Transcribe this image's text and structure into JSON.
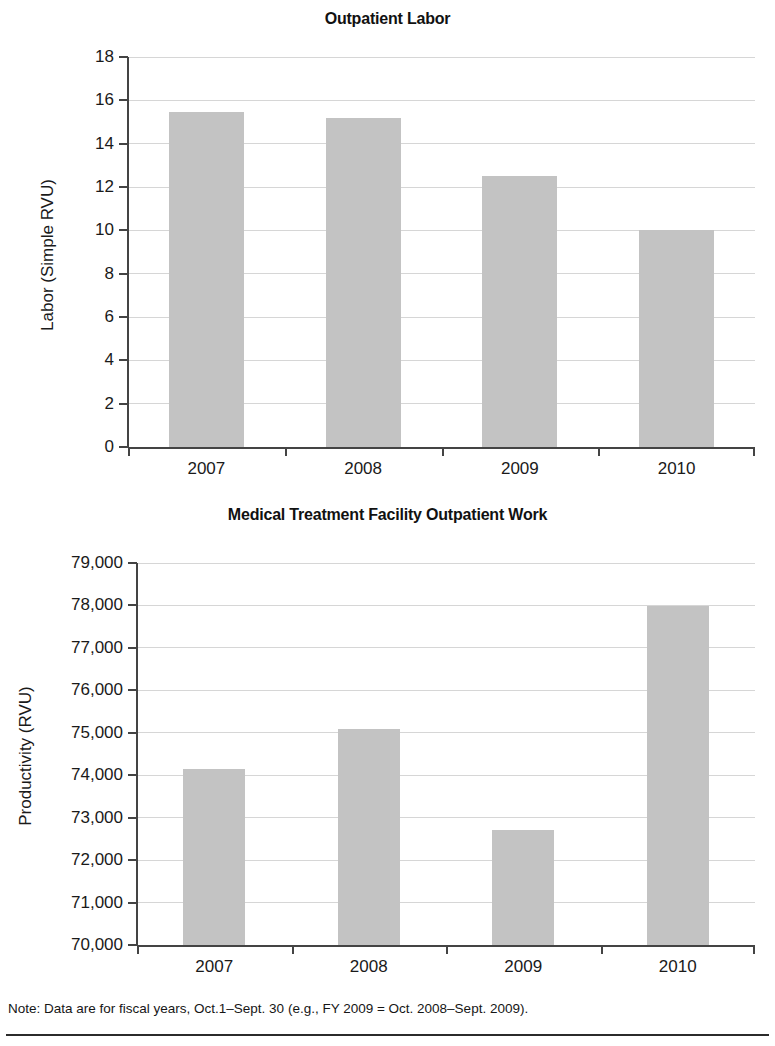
{
  "page": {
    "note": "Note: Data are for fiscal years, Oct.1–Sept. 30 (e.g., FY 2009 = Oct. 2008–Sept. 2009)."
  },
  "chart_data": [
    {
      "type": "bar",
      "title": "Outpatient Labor",
      "xlabel": "",
      "ylabel": "Labor (Simple RVU)",
      "categories": [
        "2007",
        "2008",
        "2009",
        "2010"
      ],
      "values": [
        15.45,
        15.2,
        12.5,
        10.0
      ],
      "ylim": [
        0,
        18
      ],
      "yticks": [
        0,
        2,
        4,
        6,
        8,
        10,
        12,
        14,
        16,
        18
      ],
      "ytick_labels": [
        "0",
        "2",
        "4",
        "6",
        "8",
        "10",
        "12",
        "14",
        "16",
        "18"
      ],
      "grid": true,
      "legend": "none",
      "bar_color": "#c3c3c3"
    },
    {
      "type": "bar",
      "title": "Medical Treatment Facility Outpatient Work",
      "xlabel": "",
      "ylabel": "Productivity (RVU)",
      "categories": [
        "2007",
        "2008",
        "2009",
        "2010"
      ],
      "values": [
        74150,
        75100,
        72700,
        77980
      ],
      "ylim": [
        70000,
        79000
      ],
      "yticks": [
        70000,
        71000,
        72000,
        73000,
        74000,
        75000,
        76000,
        77000,
        78000,
        79000
      ],
      "ytick_labels": [
        "70,000",
        "71,000",
        "72,000",
        "73,000",
        "74,000",
        "75,000",
        "76,000",
        "77,000",
        "78,000",
        "79,000"
      ],
      "grid": true,
      "legend": "none",
      "bar_color": "#c3c3c3"
    }
  ]
}
